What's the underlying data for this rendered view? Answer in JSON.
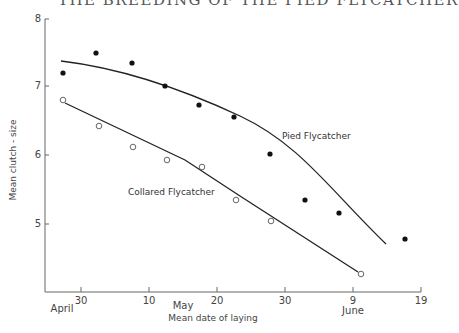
{
  "page": {
    "running_header": "THE BREEDING OF THE PIED FLYCATCHER"
  },
  "chart_data": {
    "type": "scatter",
    "title": "",
    "xlabel": "Mean date of laying",
    "ylabel": "Mean clutch - size",
    "ylim": [
      4.1,
      8
    ],
    "y_ticks": [
      "5",
      "6",
      "7",
      "8"
    ],
    "x_ticks": [
      {
        "label": "30",
        "month": "April"
      },
      {
        "label": "10",
        "month": ""
      },
      {
        "label": "20",
        "month": "May"
      },
      {
        "label": "30",
        "month": ""
      },
      {
        "label": "9",
        "month": "June"
      },
      {
        "label": "19",
        "month": ""
      }
    ],
    "x_month_labels": [
      "April",
      "May",
      "June"
    ],
    "grid": false,
    "legend": "inline labels",
    "series": [
      {
        "name": "Pied Flycatcher",
        "marker": "filled circle",
        "x": [
          "Apr 25",
          "Apr 30",
          "May 5",
          "May 10",
          "May 15",
          "May 21",
          "May 26",
          "May 31",
          "Jun 5",
          "Jun 15"
        ],
        "values": [
          7.62,
          7.52,
          7.35,
          7.02,
          6.74,
          6.55,
          6.02,
          5.36,
          5.17,
          4.79
        ],
        "fit": "curve, concave downward"
      },
      {
        "name": "Collared Flycatcher",
        "marker": "open circle",
        "x": [
          "Apr 25",
          "Apr 30",
          "May 5",
          "May 10",
          "May 15",
          "May 21",
          "May 26",
          "Jun 10"
        ],
        "values": [
          6.8,
          6.42,
          6.12,
          5.93,
          5.83,
          5.35,
          5.05,
          4.27
        ],
        "fit": "straight line"
      }
    ]
  },
  "geom": {
    "plot": {
      "x0": 45,
      "y_top": 19,
      "y_bottom": 292,
      "x_right": 421
    },
    "y_axis_ticks_px": [
      224,
      155,
      86,
      19
    ],
    "x_axis_ticks_px": [
      81,
      149,
      217,
      285,
      353,
      421
    ],
    "pied_points_px": [
      [
        63,
        73
      ],
      [
        96,
        53
      ],
      [
        132,
        63
      ],
      [
        165,
        86
      ],
      [
        199,
        105
      ],
      [
        234,
        117
      ],
      [
        270,
        154
      ],
      [
        305,
        200
      ],
      [
        339,
        213
      ],
      [
        405,
        239
      ]
    ],
    "collared_points_px": [
      [
        63,
        100
      ],
      [
        99,
        126
      ],
      [
        133,
        147
      ],
      [
        167,
        160
      ],
      [
        202,
        167
      ],
      [
        236,
        200
      ],
      [
        271,
        221
      ],
      [
        361,
        274
      ]
    ],
    "pied_curve": "M61,61 C120,68 180,88 240,116 S330,190 386,244",
    "collared_line": "M65,103 L 185,160 L 240,196 L 358,272"
  }
}
